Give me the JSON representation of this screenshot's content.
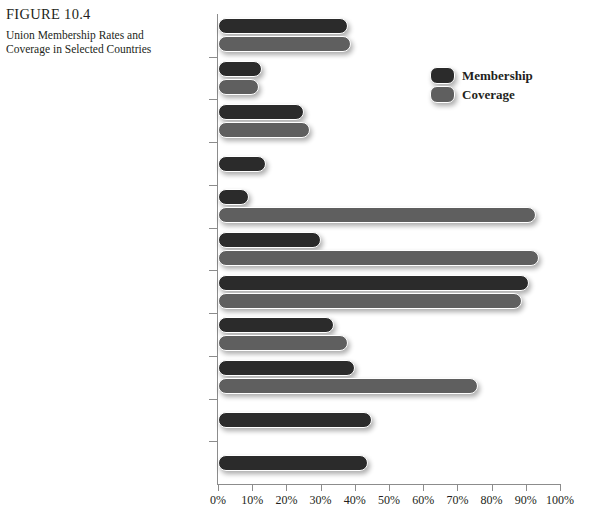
{
  "figure": {
    "number": "FIGURE 10.4",
    "title": "Union Membership Rates and Coverage in Selected Countries"
  },
  "legend": {
    "position": "top-right",
    "items": [
      {
        "label": "Membership",
        "color": "#2b2b2b",
        "swatch": "membership-swatch"
      },
      {
        "label": "Coverage",
        "color": "#5f5f5f",
        "swatch": "coverage-swatch"
      }
    ]
  },
  "chart_data": {
    "type": "bar",
    "orientation": "horizontal",
    "title": "Union Membership Rates and Coverage in Selected Countries",
    "xlabel": "",
    "ylabel": "",
    "xlim": [
      0,
      100
    ],
    "xtick_labels": [
      "0%",
      "10%",
      "20%",
      "30%",
      "40%",
      "50%",
      "60%",
      "70%",
      "80%",
      "90%",
      "100%"
    ],
    "xtick_values": [
      0,
      10,
      20,
      30,
      40,
      50,
      60,
      70,
      80,
      90,
      100
    ],
    "grid": false,
    "categories": [
      "Canada",
      "United States",
      "Japan",
      "Korea",
      "France",
      "Germany",
      "Sweden",
      "United Kingdom",
      "Argentina",
      "Brazil",
      "Mexico"
    ],
    "series": [
      {
        "name": "Membership",
        "color": "#2b2b2b",
        "values": [
          38,
          13,
          25,
          14,
          9,
          30,
          91,
          34,
          40,
          45,
          44
        ]
      },
      {
        "name": "Coverage",
        "color": "#5f5f5f",
        "values": [
          39,
          12,
          27,
          null,
          93,
          94,
          89,
          38,
          76,
          null,
          null
        ]
      }
    ]
  }
}
